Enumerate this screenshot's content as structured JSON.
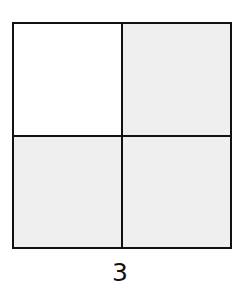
{
  "figure": {
    "rows": 2,
    "cols": 2,
    "cells": [
      {
        "position": "top-left",
        "shaded": false,
        "color": "#ffffff"
      },
      {
        "position": "top-right",
        "shaded": true,
        "color": "#efefef"
      },
      {
        "position": "bottom-left",
        "shaded": true,
        "color": "#efefef"
      },
      {
        "position": "bottom-right",
        "shaded": true,
        "color": "#efefef"
      }
    ],
    "shaded_count": 3,
    "total_cells": 4,
    "line_color": "#111111",
    "label": "3"
  }
}
